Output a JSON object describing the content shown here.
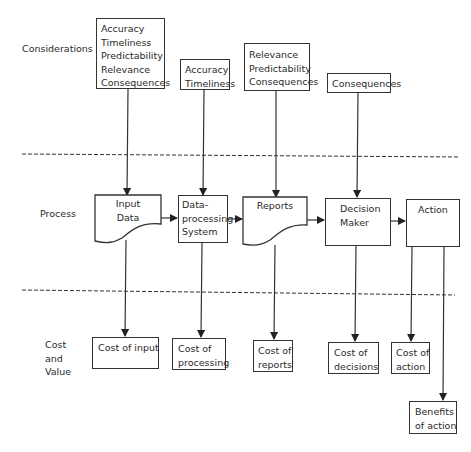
{
  "rows": {
    "considerations": "Considerations",
    "process": "Process",
    "cost_value": [
      "Cost",
      "and",
      "Value"
    ]
  },
  "considerations": [
    {
      "items": [
        "Accuracy",
        "Timeliness",
        "Predictability",
        "Relevance",
        "Consequences"
      ]
    },
    {
      "items": [
        "Accuracy",
        "Timeliness"
      ]
    },
    {
      "items": [
        "Relevance",
        "Predictability",
        "Consequences"
      ]
    },
    {
      "items": [
        "Consequences"
      ]
    }
  ],
  "process": [
    {
      "shape": "document",
      "lines": [
        "Input",
        "Data"
      ]
    },
    {
      "shape": "rectangle",
      "lines": [
        "Data-",
        "processing",
        "System"
      ]
    },
    {
      "shape": "document",
      "lines": [
        "Reports"
      ]
    },
    {
      "shape": "rectangle",
      "lines": [
        "Decision",
        "Maker"
      ]
    },
    {
      "shape": "rectangle",
      "lines": [
        "Action"
      ]
    }
  ],
  "outcomes": [
    {
      "lines": [
        "Cost of input"
      ]
    },
    {
      "lines": [
        "Cost of",
        "processing"
      ]
    },
    {
      "lines": [
        "Cost of",
        "reports"
      ]
    },
    {
      "lines": [
        "Cost of",
        "decisions"
      ]
    },
    {
      "lines": [
        "Cost of",
        "action"
      ]
    },
    {
      "lines": [
        "Benefits",
        "of action"
      ]
    }
  ],
  "colors": {
    "stroke": "#333333",
    "text": "#2a2a2a",
    "background": "#ffffff"
  }
}
